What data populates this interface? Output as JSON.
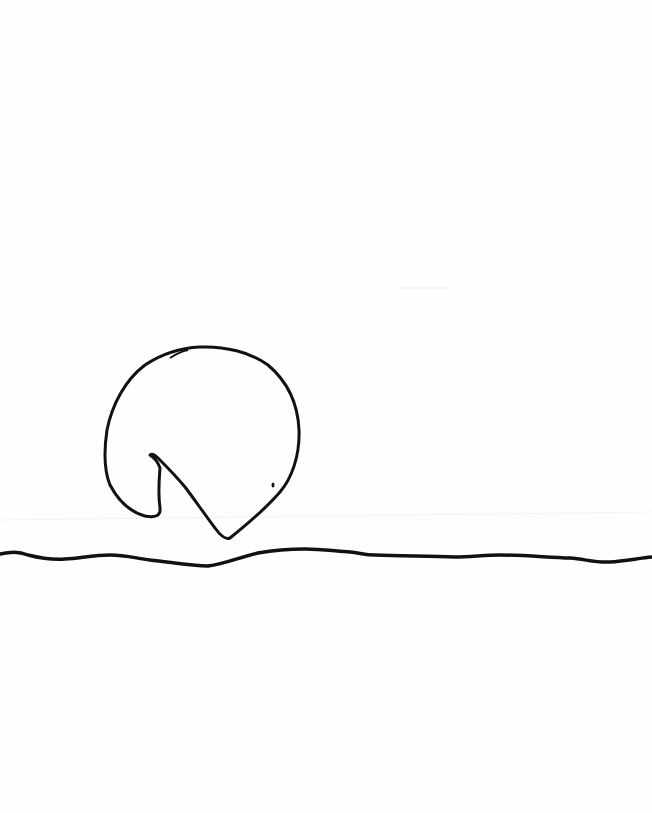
{
  "image": {
    "description": "Hand-drawn line sketch: a round shape with a wedge cut out (like a sun or pac-man) resting on a wavy horizon line",
    "background_color": "#fefefe",
    "stroke_color": "#111111",
    "caption": "Line drawing of a circular shape with a notch above a wavy horizon"
  }
}
